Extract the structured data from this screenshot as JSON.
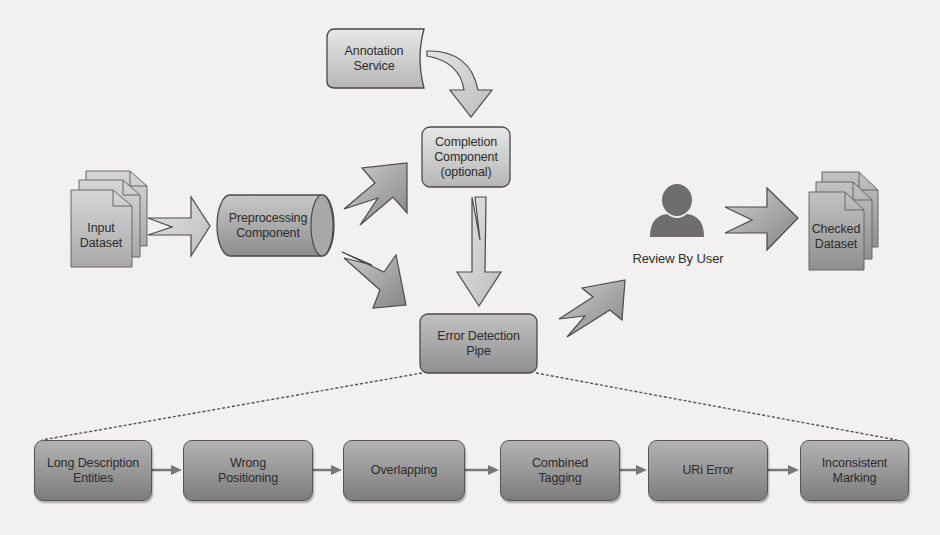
{
  "diagram": {
    "nodes": {
      "annotation_service": {
        "line1": "Annotation",
        "line2": "Service"
      },
      "completion_component": {
        "line1": "Completion",
        "line2": "Component",
        "line3": "(optional)"
      },
      "input_dataset": {
        "line1": "Input",
        "line2": "Dataset"
      },
      "preprocessing_component": {
        "line1": "Preprocessing",
        "line2": "Component"
      },
      "error_detection_pipe": {
        "line1": "Error Detection",
        "line2": "Pipe"
      },
      "review_by_user": {
        "label": "Review By User",
        "icon": "user-icon"
      },
      "checked_dataset": {
        "line1": "Checked",
        "line2": "Dataset"
      }
    },
    "pipeline_steps": [
      {
        "line1": "Long Description",
        "line2": "Entities"
      },
      {
        "line1": "Wrong",
        "line2": "Positioning"
      },
      {
        "line1": "Overlapping",
        "line2": ""
      },
      {
        "line1": "Combined",
        "line2": "Tagging"
      },
      {
        "line1": "URi Error",
        "line2": ""
      },
      {
        "line1": "Inconsistent",
        "line2": "Marking"
      }
    ],
    "edges": [
      {
        "from": "annotation_service",
        "to": "completion_component",
        "style": "curved-block-arrow"
      },
      {
        "from": "input_dataset",
        "to": "preprocessing_component",
        "style": "block-arrow"
      },
      {
        "from": "preprocessing_component",
        "to": "completion_component",
        "style": "block-arrow"
      },
      {
        "from": "preprocessing_component",
        "to": "error_detection_pipe",
        "style": "block-arrow"
      },
      {
        "from": "completion_component",
        "to": "error_detection_pipe",
        "style": "block-arrow"
      },
      {
        "from": "error_detection_pipe",
        "to": "review_by_user",
        "style": "block-arrow"
      },
      {
        "from": "review_by_user",
        "to": "checked_dataset",
        "style": "block-arrow"
      },
      {
        "from": "error_detection_pipe",
        "to": "pipeline_steps",
        "style": "dotted-expansion"
      }
    ],
    "colors": {
      "background": "#f2f1ef",
      "light_fill_top": "#e6e6e6",
      "light_fill_bottom": "#b9b9b9",
      "dark_fill_top": "#a9a9a9",
      "dark_fill_bottom": "#6e6e6e",
      "stroke": "#4a4a4a",
      "text": "#2b2b2b"
    }
  }
}
